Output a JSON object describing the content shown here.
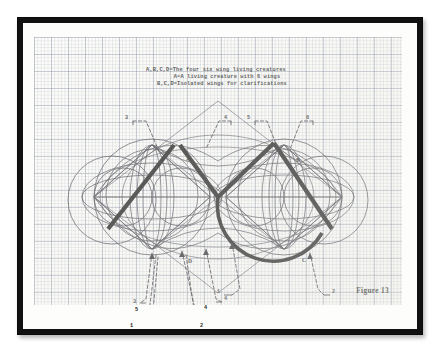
{
  "figure": {
    "title_lines": [
      "A,B,C,D=The four six wing living creatures",
      "A=A living creature  with 6 wings",
      "B,C,D=Isolated wings for clarifications"
    ],
    "figure_caption": "Figure 13",
    "letter_labels": [
      {
        "text": "A",
        "x": 152,
        "y": 120
      },
      {
        "text": "B",
        "x": 262,
        "y": 121
      },
      {
        "text": "C",
        "x": 268,
        "y": 221
      },
      {
        "text": "D",
        "x": 154,
        "y": 222
      }
    ],
    "callouts_top": [
      {
        "text": "3",
        "x": 91,
        "y": 82
      },
      {
        "text": "4",
        "x": 190,
        "y": 82
      },
      {
        "text": "5",
        "x": 213,
        "y": 82
      },
      {
        "text": "6",
        "x": 272,
        "y": 82
      }
    ],
    "callouts_bottom": [
      {
        "text": "3",
        "x": 105,
        "y": 270
      },
      {
        "text": "5",
        "x": 105,
        "y": 277
      },
      {
        "text": "1",
        "x": 99,
        "y": 292
      },
      {
        "text": "4",
        "x": 162,
        "y": 276
      },
      {
        "text": "2",
        "x": 158,
        "y": 293
      },
      {
        "text": "4",
        "x": 180,
        "y": 268
      },
      {
        "text": "1",
        "x": 194,
        "y": 262
      },
      {
        "text": "2",
        "x": 285,
        "y": 262
      }
    ],
    "colors": {
      "frame": "#111111",
      "paper": "#fbfbf8",
      "grid_minor": "#6e768c",
      "grid_major": "#5a647d",
      "ink_bold": "#0c0c0c",
      "ink_thin": "#2e2e38",
      "ink_dashed": "#1c1c24"
    }
  }
}
